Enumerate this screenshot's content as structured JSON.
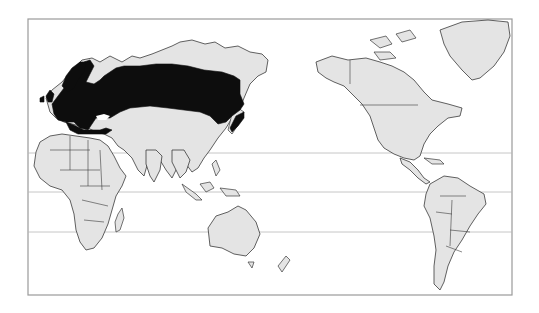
{
  "map": {
    "title": "Species distribution range",
    "projection": "Pacific-centered world map",
    "colors": {
      "background": "#ffffff",
      "land": "#e4e4e4",
      "outline": "#3a3a3a",
      "range": "#0d0d0d",
      "frame": "#9a9a9a",
      "gridline": "#b8b8b8"
    },
    "frame": {
      "x": 28,
      "y": 19,
      "width": 484,
      "height": 276
    },
    "reference_lines": [
      {
        "name": "Tropic of Cancer",
        "y": 153
      },
      {
        "name": "Equator",
        "y": 192
      },
      {
        "name": "Tropic of Capricorn",
        "y": 232
      }
    ],
    "highlighted_range": {
      "label": "Distribution range",
      "regions": [
        "Europe",
        "Northern Asia / Siberia",
        "Japan",
        "Northern Mediterranean"
      ]
    },
    "continents": [
      "Europe",
      "Asia",
      "Africa",
      "Australia",
      "North America",
      "South America",
      "Greenland"
    ]
  }
}
